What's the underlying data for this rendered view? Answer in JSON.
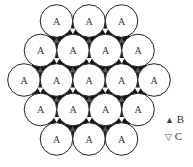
{
  "diagram": {
    "circle_label": "A",
    "radius": 16.3,
    "rows": [
      {
        "y": 21,
        "xs": [
          56.5,
          89,
          121.5
        ]
      },
      {
        "y": 50.5,
        "xs": [
          40.5,
          73,
          105.5,
          138
        ]
      },
      {
        "y": 80,
        "xs": [
          24,
          56.5,
          89,
          121.5,
          154
        ]
      },
      {
        "y": 109.5,
        "xs": [
          40.5,
          73,
          105.5,
          138
        ]
      },
      {
        "y": 139,
        "xs": [
          56.5,
          89,
          121.5
        ]
      }
    ],
    "colors": {
      "fill_gap": "#111111",
      "circle_fill": "#ffffff",
      "circle_stroke": "#222222",
      "b_site": "#555555",
      "c_site": "#ffffff"
    }
  },
  "legend": {
    "items": [
      {
        "symbol": "▲",
        "label": "B"
      },
      {
        "symbol": "▽",
        "label": "C"
      }
    ]
  }
}
